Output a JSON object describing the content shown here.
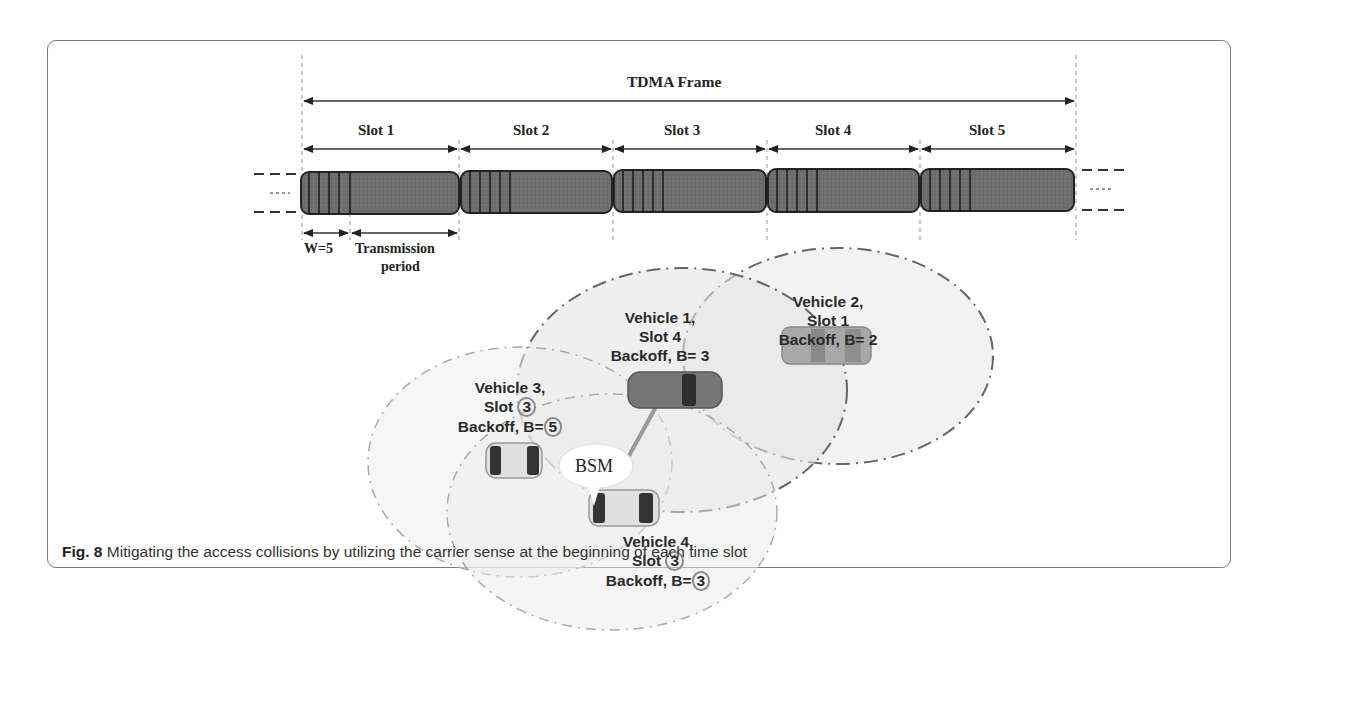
{
  "figure": {
    "title": "TDMA Frame",
    "slots": [
      {
        "label": "Slot 1"
      },
      {
        "label": "Slot 2"
      },
      {
        "label": "Slot 3"
      },
      {
        "label": "Slot 4"
      },
      {
        "label": "Slot 5"
      }
    ],
    "window_label": "W=5",
    "transmission_label_line1": "Transmission",
    "transmission_label_line2": "period",
    "bsm_label": "BSM",
    "vehicles": [
      {
        "name": "Vehicle 1,",
        "slot_prefix": "Slot ",
        "slot": "4",
        "backoff_prefix": "Backoff, B= ",
        "backoff": "3",
        "color": "#7a7a7a"
      },
      {
        "name": "Vehicle 2,",
        "slot_prefix": "Slot ",
        "slot": "1",
        "backoff_prefix": "Backoff, B= ",
        "backoff": "2",
        "color": "#a5a5a5"
      },
      {
        "name": "Vehicle 3,",
        "slot_prefix": "Slot ",
        "slot": "3",
        "backoff_prefix": "Backoff, B=",
        "backoff": "5",
        "color": "#d8d8d8"
      },
      {
        "name": "Vehicle 4,",
        "slot_prefix": "Slot ",
        "slot": "3",
        "backoff_prefix": "Backoff, B=",
        "backoff": "3",
        "color": "#d8d8d8"
      }
    ]
  },
  "caption": {
    "label": "Fig. 8",
    "text": " Mitigating the access collisions by utilizing the carrier sense at the beginning of each time slot"
  }
}
